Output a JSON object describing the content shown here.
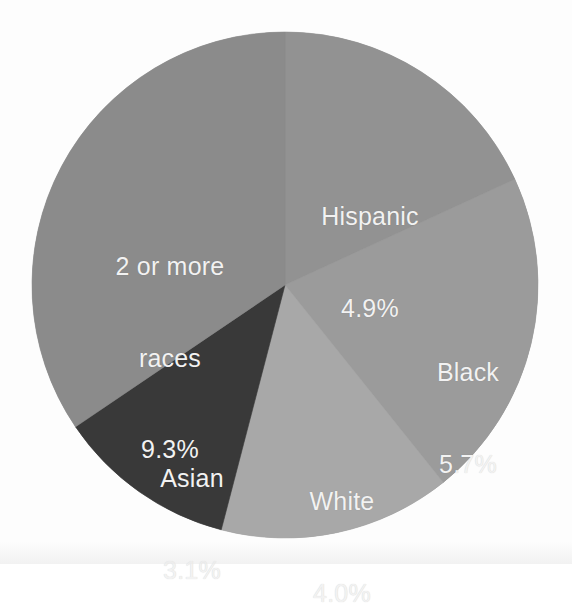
{
  "figure": {
    "background_color": "#fdfdfd",
    "label_text_color": "#f2f2f2"
  },
  "chart_data": {
    "type": "pie",
    "title": "",
    "subtitle": "",
    "xlabel": "",
    "ylabel": "",
    "legend_position": "none",
    "grid": false,
    "value_unit": "percent",
    "value_suffix": "%",
    "start_angle_deg": 0,
    "direction": "clockwise",
    "center": {
      "x": 285,
      "y": 285
    },
    "radius": 253,
    "total_labeled_percent": 27.0,
    "categories": [
      "Hispanic",
      "Black",
      "White",
      "Asian",
      "2 or more races"
    ],
    "values": [
      4.9,
      5.7,
      4.0,
      3.1,
      9.3
    ],
    "value_labels": [
      "4.9%",
      "5.7%",
      "4.0%",
      "3.1%",
      "9.3%"
    ],
    "colors": [
      "#929292",
      "#9b9b9b",
      "#a8a8a8",
      "#393939",
      "#8b8b8b"
    ],
    "slices": [
      {
        "name": "Hispanic",
        "label_lines": [
          "Hispanic"
        ],
        "value": 4.9,
        "value_label": "4.9%",
        "color": "#929292",
        "start_angle_deg": 0,
        "end_angle_deg": 65.3
      },
      {
        "name": "Black",
        "label_lines": [
          "Black"
        ],
        "value": 5.7,
        "value_label": "5.7%",
        "color": "#9b9b9b",
        "start_angle_deg": 65.3,
        "end_angle_deg": 141.3
      },
      {
        "name": "White",
        "label_lines": [
          "White"
        ],
        "value": 4.0,
        "value_label": "4.0%",
        "color": "#a8a8a8",
        "start_angle_deg": 141.3,
        "end_angle_deg": 194.6
      },
      {
        "name": "Asian",
        "label_lines": [
          "Asian"
        ],
        "value": 3.1,
        "value_label": "3.1%",
        "color": "#393939",
        "start_angle_deg": 194.6,
        "end_angle_deg": 235.9
      },
      {
        "name": "2 or more races",
        "label_lines": [
          "2 or more",
          "races"
        ],
        "value": 9.3,
        "value_label": "9.3%",
        "color": "#8b8b8b",
        "start_angle_deg": 235.9,
        "end_angle_deg": 360
      }
    ]
  },
  "labels": {
    "hispanic": {
      "name": "Hispanic",
      "value": "4.9%"
    },
    "black": {
      "name": "Black",
      "value": "5.7%"
    },
    "white": {
      "name": "White",
      "value": "4.0%"
    },
    "asian": {
      "name": "Asian",
      "value": "3.1%"
    },
    "tworaces": {
      "line1": "2 or more",
      "line2": "races",
      "value": "9.3%"
    }
  }
}
